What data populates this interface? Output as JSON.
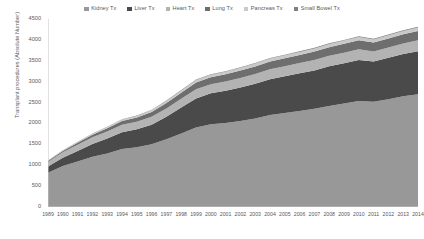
{
  "chart_data": {
    "type": "area",
    "stacked": true,
    "title": "",
    "xlabel": "",
    "ylabel": "Transplant procedures (Absolute Number)",
    "grid": false,
    "legend_position": "top",
    "ylim": [
      0,
      4500
    ],
    "yticks": [
      0,
      500,
      1000,
      1500,
      2000,
      2500,
      3000,
      3500,
      4000,
      4500
    ],
    "categories": [
      "1989",
      "1990",
      "1991",
      "1992",
      "1993",
      "1994",
      "1995",
      "1996",
      "1997",
      "1998",
      "1999",
      "2000",
      "2001",
      "2002",
      "2003",
      "2004",
      "2005",
      "2006",
      "2007",
      "2008",
      "2009",
      "2010",
      "2011",
      "2012",
      "2013",
      "2014"
    ],
    "series": [
      {
        "name": "Kidney Tx",
        "color": "#989898",
        "values": [
          820,
          980,
          1090,
          1200,
          1280,
          1390,
          1430,
          1500,
          1620,
          1760,
          1900,
          1980,
          2010,
          2060,
          2120,
          2200,
          2250,
          2300,
          2350,
          2420,
          2480,
          2540,
          2520,
          2580,
          2650,
          2700
        ]
      },
      {
        "name": "Liver Tx",
        "color": "#4a4a4a",
        "values": [
          150,
          200,
          250,
          310,
          360,
          400,
          430,
          470,
          540,
          620,
          700,
          740,
          770,
          800,
          830,
          860,
          880,
          900,
          920,
          950,
          960,
          980,
          960,
          990,
          1010,
          1030
        ]
      },
      {
        "name": "Heart Tx",
        "color": "#b3b3b3",
        "values": [
          110,
          130,
          150,
          160,
          170,
          180,
          180,
          190,
          200,
          210,
          220,
          220,
          225,
          230,
          235,
          240,
          240,
          245,
          250,
          250,
          255,
          255,
          245,
          250,
          255,
          260
        ]
      },
      {
        "name": "Lung Tx",
        "color": "#6e6e6e",
        "values": [
          20,
          30,
          45,
          60,
          75,
          90,
          100,
          115,
          130,
          145,
          160,
          165,
          170,
          175,
          180,
          185,
          190,
          195,
          200,
          205,
          210,
          215,
          210,
          215,
          220,
          225
        ]
      },
      {
        "name": "Pancreas Tx",
        "color": "#c9c9c9",
        "values": [
          10,
          15,
          20,
          25,
          30,
          35,
          40,
          45,
          50,
          55,
          60,
          62,
          64,
          66,
          68,
          70,
          70,
          72,
          74,
          76,
          78,
          80,
          76,
          78,
          80,
          82
        ]
      },
      {
        "name": "Small Bowel Tx",
        "color": "#7f7f7f",
        "values": [
          2,
          3,
          4,
          5,
          6,
          7,
          8,
          9,
          10,
          11,
          12,
          12,
          13,
          13,
          14,
          14,
          15,
          15,
          16,
          16,
          17,
          17,
          16,
          17,
          18,
          18
        ]
      }
    ]
  },
  "legend": {
    "items": [
      {
        "label": "Kidney Tx"
      },
      {
        "label": "Liver Tx"
      },
      {
        "label": "Heart Tx"
      },
      {
        "label": "Lung Tx"
      },
      {
        "label": "Pancreas Tx"
      },
      {
        "label": "Small Bowel Tx"
      }
    ]
  },
  "axes": {
    "y_title": "Transplant procedures (Absolute Number)",
    "axis_color": "#c4c4c4",
    "tick_color": "#c4c4c4",
    "text_color": "#595959"
  }
}
